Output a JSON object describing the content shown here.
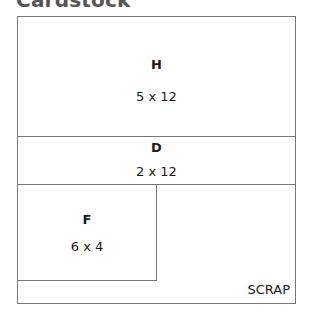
{
  "title": "Cardstock",
  "pieces": [
    {
      "id": "H",
      "size": "5 x 12"
    },
    {
      "id": "D",
      "size": "2 x 12"
    },
    {
      "id": "F",
      "size": "6 x 4"
    }
  ],
  "scrap_label": "SCRAP"
}
